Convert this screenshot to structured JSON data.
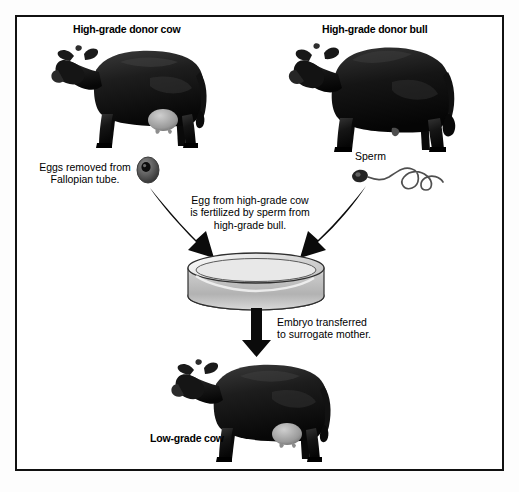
{
  "diagram": {
    "background_color": "#ffffff",
    "border_color": "#111111",
    "ink_color": "#000000",
    "labels": {
      "donor_cow": "High-grade donor cow",
      "donor_bull": "High-grade donor bull",
      "eggs_line1": "Eggs removed from",
      "eggs_line2": "Fallopian tube.",
      "sperm": "Sperm",
      "fertilize_line1": "Egg from high-grade cow",
      "fertilize_line2": "is fertilized by sperm from",
      "fertilize_line3": "high-grade bull.",
      "embryo_line1": "Embryo transferred",
      "embryo_line2": "to surrogate mother.",
      "surrogate_cow": "Low-grade cow"
    },
    "figures": [
      {
        "name": "donor-cow",
        "kind": "cow",
        "facing": "left",
        "fill": "#1b1b1b",
        "has_udder": true
      },
      {
        "name": "donor-bull",
        "kind": "bull",
        "facing": "left",
        "fill": "#171717",
        "has_udder": false
      },
      {
        "name": "surrogate-cow",
        "kind": "cow",
        "facing": "left",
        "fill": "#1b1b1b",
        "has_udder": true
      },
      {
        "name": "egg-cell",
        "kind": "egg",
        "fill": "#5d5d5d",
        "nucleus_fill": "#101010"
      },
      {
        "name": "sperm-cell",
        "kind": "sperm",
        "head_fill": "#2a2a2a",
        "tail_stroke": "#4a4a4a"
      },
      {
        "name": "petri-dish",
        "kind": "dish",
        "rim_fill": "#d8d8d8",
        "wall_fill": "#bdbdbd"
      }
    ],
    "arrows": [
      {
        "name": "egg-to-dish",
        "kind": "curved",
        "from": "egg-cell",
        "to": "petri-dish",
        "direction": "down-right"
      },
      {
        "name": "sperm-to-dish",
        "kind": "curved",
        "from": "sperm-cell",
        "to": "petri-dish",
        "direction": "down-left"
      },
      {
        "name": "dish-to-cow",
        "kind": "straight",
        "from": "petri-dish",
        "to": "surrogate-cow",
        "direction": "down"
      }
    ]
  }
}
